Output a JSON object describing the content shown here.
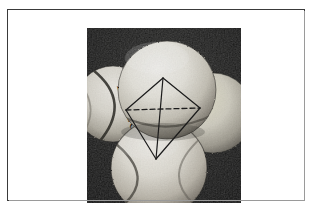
{
  "page": {
    "background_color": "#ffffff",
    "width": 313,
    "height": 210
  },
  "figure": {
    "frame_color": "#3a3a3a",
    "frame_shadow_color": "#9a9a9a",
    "caption": ""
  },
  "photo": {
    "alt": "Four tennis balls stacked in a tetrahedral arrangement with a tetrahedron wireframe drawn over them",
    "background_color": "#141414",
    "ball_color_light": "#f2f0ea",
    "ball_color_mid": "#cfcbc0",
    "ball_color_shadow": "#6e6a62",
    "brand_text": "DUNLOP",
    "brand_text_color": "#1a1a1a",
    "balls": [
      {
        "name": "ball-top-front",
        "cx": 80,
        "cy": 62,
        "r": 49
      },
      {
        "name": "ball-left-rear",
        "cx": 26,
        "cy": 76,
        "r": 38
      },
      {
        "name": "ball-right-rear",
        "cx": 126,
        "cy": 85,
        "r": 40
      },
      {
        "name": "ball-bottom-front",
        "cx": 72,
        "cy": 140,
        "r": 48
      }
    ],
    "overlay": {
      "name": "tetrahedron-wireframe",
      "line_color": "#1a1a1a",
      "line_width": 1.1,
      "dash_pattern": "5,3",
      "vertices": {
        "apex_top": {
          "x": 76,
          "y": 50
        },
        "left_rear": {
          "x": 39,
          "y": 82
        },
        "right_rear": {
          "x": 113,
          "y": 80
        },
        "bottom_front": {
          "x": 69,
          "y": 131
        }
      },
      "solid_edges": [
        [
          "apex_top",
          "right_rear"
        ],
        [
          "apex_top",
          "bottom_front"
        ],
        [
          "right_rear",
          "bottom_front"
        ],
        [
          "apex_top",
          "left_rear"
        ],
        [
          "left_rear",
          "bottom_front"
        ]
      ],
      "hidden_edges": [
        [
          "left_rear",
          "right_rear"
        ]
      ]
    }
  }
}
